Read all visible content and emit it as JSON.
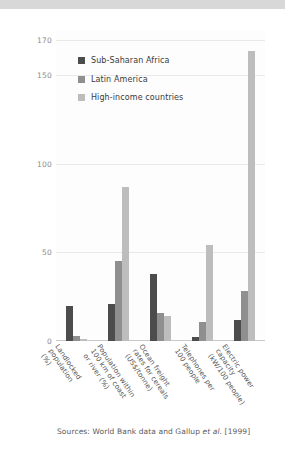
{
  "figure": {
    "source_note": "Sources: World Bank data and Gallup et al. [1999]"
  },
  "chart_data": {
    "type": "bar",
    "title": "",
    "subtitle": "",
    "xlabel": "",
    "ylabel": "",
    "ylim": [
      0,
      175
    ],
    "yticks": [
      0,
      50,
      100,
      150,
      170
    ],
    "ytick_labels": [
      "0",
      "50",
      "100",
      "150",
      "170"
    ],
    "grid": true,
    "legend_position": "upper-left-inside",
    "categories": [
      "Landlocked\npopulation\n(%)",
      "Population within\n100 km of coast\nor river (%)",
      "Ocean freight\nrates for cereals\n(US$/tonne)",
      "Telephones per\n100 people",
      "Electric power\ncapacity\n(kW/100 people)"
    ],
    "series": [
      {
        "name": "Sub-Saharan Africa",
        "color": "#4c4c4c",
        "values": [
          20,
          21,
          38,
          2,
          12
        ]
      },
      {
        "name": "Latin America",
        "color": "#8f8f8f",
        "values": [
          3,
          45,
          16,
          11,
          28
        ]
      },
      {
        "name": "High-income countries",
        "color": "#bdbdbd",
        "values": [
          1,
          87,
          14,
          54,
          164
        ]
      }
    ]
  }
}
